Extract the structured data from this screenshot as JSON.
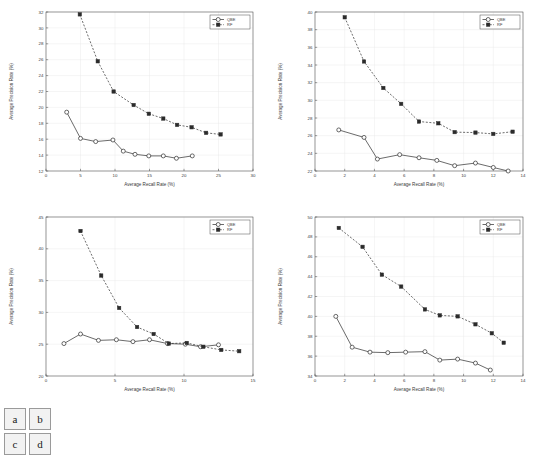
{
  "figure": {
    "panel_labels": [
      "a",
      "b",
      "c",
      "d"
    ],
    "axis_label_x": "Average Recall Rate (%)",
    "axis_label_y": "Average Precision Rate (%)",
    "legend": {
      "qbe": "QBE",
      "rf": "RF"
    },
    "colors": {
      "line": "#2b2b2b",
      "grid": "#e8e8e8",
      "axis": "#4d4d4d",
      "text": "#3a3a3a"
    }
  },
  "chart_data": [
    {
      "id": "a",
      "type": "line",
      "title": "",
      "xlabel": "Average Recall Rate (%)",
      "ylabel": "Average Precision Rate (%)",
      "xlim": [
        0,
        30
      ],
      "ylim": [
        12,
        32
      ],
      "xticks": [
        0,
        5,
        10,
        15,
        20,
        25,
        30
      ],
      "yticks": [
        12,
        14,
        16,
        18,
        20,
        22,
        24,
        26,
        28,
        30,
        32
      ],
      "grid": true,
      "legend_position": "top-right",
      "series": [
        {
          "name": "QBE",
          "marker": "open-circle",
          "linestyle": "solid",
          "x": [
            3.0,
            5.0,
            7.2,
            9.7,
            11.2,
            12.9,
            14.9,
            17.0,
            18.9,
            21.2
          ],
          "y": [
            19.4,
            16.1,
            15.7,
            15.9,
            14.5,
            14.1,
            13.9,
            13.9,
            13.6,
            13.9
          ]
        },
        {
          "name": "RF",
          "marker": "filled-square",
          "linestyle": "dashed",
          "x": [
            4.9,
            7.5,
            9.8,
            12.7,
            14.9,
            17.0,
            19.0,
            21.1,
            23.2,
            25.3
          ],
          "y": [
            31.7,
            25.8,
            22.0,
            20.3,
            19.2,
            18.6,
            17.8,
            17.5,
            16.8,
            16.6
          ]
        }
      ]
    },
    {
      "id": "b",
      "type": "line",
      "title": "",
      "xlabel": "Average Recall Rate (%)",
      "ylabel": "Average Precision Rate (%)",
      "xlim": [
        0,
        14
      ],
      "ylim": [
        22,
        40
      ],
      "xticks": [
        0,
        2,
        4,
        6,
        8,
        10,
        12,
        14
      ],
      "yticks": [
        22,
        24,
        26,
        28,
        30,
        32,
        34,
        36,
        38,
        40
      ],
      "grid": true,
      "legend_position": "top-right",
      "series": [
        {
          "name": "QBE",
          "marker": "open-circle",
          "linestyle": "solid",
          "x": [
            1.6,
            3.3,
            4.2,
            5.7,
            7.0,
            8.2,
            9.4,
            10.8,
            12.0,
            13.0
          ],
          "y": [
            26.65,
            25.8,
            23.35,
            23.85,
            23.5,
            23.2,
            22.6,
            22.9,
            22.4,
            22.0
          ]
        },
        {
          "name": "RF",
          "marker": "filled-square",
          "linestyle": "dashed",
          "x": [
            2.0,
            3.3,
            4.6,
            5.8,
            7.0,
            8.3,
            9.4,
            10.8,
            12.0,
            13.3
          ],
          "y": [
            39.4,
            34.4,
            31.4,
            29.6,
            27.6,
            27.4,
            26.4,
            26.35,
            26.2,
            26.45
          ]
        }
      ]
    },
    {
      "id": "c",
      "type": "line",
      "title": "",
      "xlabel": "Average Recall Rate (%)",
      "ylabel": "Average Precision Rate (%)",
      "xlim": [
        0,
        15
      ],
      "ylim": [
        20,
        45
      ],
      "xticks": [
        0,
        5,
        10,
        15
      ],
      "yticks": [
        20,
        25,
        30,
        35,
        40,
        45
      ],
      "grid": true,
      "legend_position": "top-right",
      "series": [
        {
          "name": "QBE",
          "marker": "open-circle",
          "linestyle": "solid",
          "x": [
            1.3,
            2.5,
            3.8,
            5.1,
            6.3,
            7.5,
            8.8,
            10.1,
            11.2,
            12.5
          ],
          "y": [
            25.1,
            26.6,
            25.6,
            25.7,
            25.4,
            25.7,
            25.1,
            25.0,
            24.6,
            24.9
          ]
        },
        {
          "name": "RF",
          "marker": "filled-square",
          "linestyle": "dashed",
          "x": [
            2.5,
            4.0,
            5.3,
            6.6,
            7.8,
            8.9,
            10.2,
            11.4,
            12.7,
            14.0
          ],
          "y": [
            42.8,
            35.8,
            30.7,
            27.7,
            26.6,
            25.1,
            25.2,
            24.6,
            24.1,
            23.9
          ]
        }
      ]
    },
    {
      "id": "d",
      "type": "line",
      "title": "",
      "xlabel": "Average Recall Rate (%)",
      "ylabel": "Average Precision Rate (%)",
      "xlim": [
        0,
        14
      ],
      "ylim": [
        34,
        50
      ],
      "xticks": [
        0,
        2,
        4,
        6,
        8,
        10,
        12,
        14
      ],
      "yticks": [
        34,
        36,
        38,
        40,
        42,
        44,
        46,
        48,
        50
      ],
      "grid": true,
      "legend_position": "top-right",
      "series": [
        {
          "name": "QBE",
          "marker": "open-circle",
          "linestyle": "solid",
          "x": [
            1.4,
            2.5,
            3.7,
            4.9,
            6.1,
            7.4,
            8.4,
            9.6,
            10.8,
            11.8
          ],
          "y": [
            40.0,
            36.9,
            36.4,
            36.35,
            36.4,
            36.45,
            35.6,
            35.7,
            35.3,
            34.6
          ]
        },
        {
          "name": "RF",
          "marker": "filled-square",
          "linestyle": "dashed",
          "x": [
            1.6,
            3.2,
            4.5,
            5.8,
            7.4,
            8.4,
            9.6,
            10.8,
            11.9,
            12.7
          ],
          "y": [
            48.9,
            47.0,
            44.2,
            43.0,
            40.7,
            40.1,
            40.0,
            39.2,
            38.3,
            37.35
          ]
        }
      ]
    }
  ]
}
